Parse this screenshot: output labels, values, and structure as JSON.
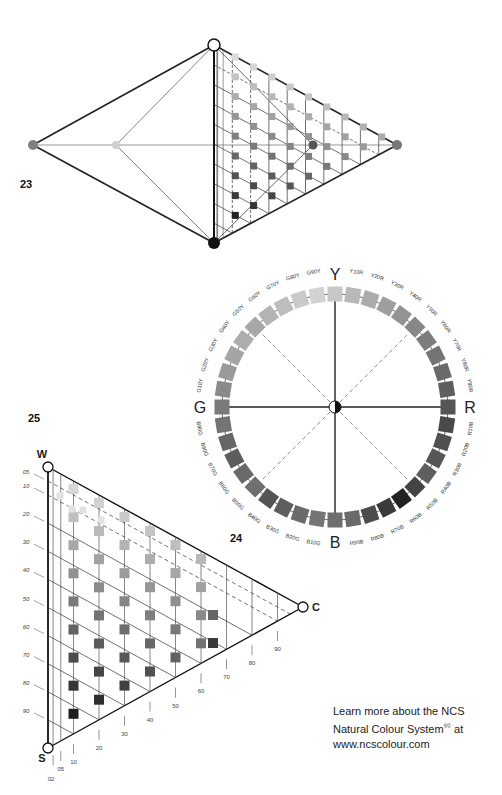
{
  "figures": {
    "fig23": {
      "number": "23",
      "description": "NCS colour solid (double cone) with triangle section",
      "nodes": {
        "white": {
          "x": 214,
          "y": 45,
          "fill": "#ffffff"
        },
        "black": {
          "x": 214,
          "y": 243,
          "fill": "#111111"
        },
        "left_hue": {
          "x": 33,
          "y": 145,
          "fill": "#808080"
        },
        "mid_hue": {
          "x": 116,
          "y": 145,
          "fill": "#cfcfcf"
        },
        "right_hue": {
          "x": 397,
          "y": 145,
          "fill": "#777777"
        },
        "inner_dot": {
          "x": 313,
          "y": 145,
          "fill": "#555555"
        }
      }
    },
    "fig24": {
      "number": "24",
      "description": "NCS colour circle",
      "center": {
        "x": 335,
        "y": 407
      },
      "radius": 113,
      "poles": {
        "Y": "Y",
        "R": "R",
        "B": "B",
        "G": "G"
      },
      "hues": [
        {
          "label": "Y",
          "shade": "#c8c8c8"
        },
        {
          "label": "Y10R",
          "shade": "#b8b8b8"
        },
        {
          "label": "Y20R",
          "shade": "#ababab"
        },
        {
          "label": "Y30R",
          "shade": "#9e9e9e"
        },
        {
          "label": "Y40R",
          "shade": "#939393"
        },
        {
          "label": "Y50R",
          "shade": "#878787"
        },
        {
          "label": "Y60R",
          "shade": "#7d7d7d"
        },
        {
          "label": "Y70R",
          "shade": "#747474"
        },
        {
          "label": "Y80R",
          "shade": "#6a6a6a"
        },
        {
          "label": "Y90R",
          "shade": "#5e5e5e"
        },
        {
          "label": "R",
          "shade": "#555555"
        },
        {
          "label": "R10B",
          "shade": "#4a4a4a"
        },
        {
          "label": "R20B",
          "shade": "#505050"
        },
        {
          "label": "R30B",
          "shade": "#575757"
        },
        {
          "label": "R40B",
          "shade": "#5e5e5e"
        },
        {
          "label": "R50B",
          "shade": "#444444"
        },
        {
          "label": "R60B",
          "shade": "#222222"
        },
        {
          "label": "R70B",
          "shade": "#3a3a3a"
        },
        {
          "label": "R80B",
          "shade": "#4c4c4c"
        },
        {
          "label": "R90B",
          "shade": "#6a6a6a"
        },
        {
          "label": "B",
          "shade": "#6e6e6e"
        },
        {
          "label": "B10G",
          "shade": "#757575"
        },
        {
          "label": "B20G",
          "shade": "#6b6b6b"
        },
        {
          "label": "B30G",
          "shade": "#5e5e5e"
        },
        {
          "label": "B40G",
          "shade": "#545454"
        },
        {
          "label": "B50G",
          "shade": "#6f6f6f"
        },
        {
          "label": "B60G",
          "shade": "#6a6a6a"
        },
        {
          "label": "B70G",
          "shade": "#5d5d5d"
        },
        {
          "label": "B80G",
          "shade": "#666666"
        },
        {
          "label": "B90G",
          "shade": "#747474"
        },
        {
          "label": "G",
          "shade": "#7a7a7a"
        },
        {
          "label": "G10Y",
          "shade": "#8a8a8a"
        },
        {
          "label": "G20Y",
          "shade": "#9a9a9a"
        },
        {
          "label": "G30Y",
          "shade": "#a4a4a4"
        },
        {
          "label": "G40Y",
          "shade": "#adadad"
        },
        {
          "label": "G50Y",
          "shade": "#a8a8a8"
        },
        {
          "label": "G60Y",
          "shade": "#b3b3b3"
        },
        {
          "label": "G70Y",
          "shade": "#bdbdbd"
        },
        {
          "label": "G80Y",
          "shade": "#cacaca"
        },
        {
          "label": "G90Y",
          "shade": "#d2d2d2"
        }
      ]
    },
    "fig25": {
      "number": "25",
      "description": "NCS colour triangle",
      "corners": {
        "W": "W",
        "S": "S",
        "C": "C"
      },
      "blackness_ticks": [
        "05",
        "10",
        "20",
        "30",
        "40",
        "50",
        "60",
        "70",
        "80",
        "90"
      ],
      "chromaticness_ticks": [
        "02",
        "05",
        "10",
        "20",
        "30",
        "40",
        "50",
        "60",
        "70",
        "80",
        "90"
      ]
    }
  },
  "footer": {
    "line1": "Learn more about the NCS",
    "line2": "Natural Colour System",
    "reg": "®©",
    "line2_end": " at",
    "line3": "www.ncscolour.com"
  }
}
